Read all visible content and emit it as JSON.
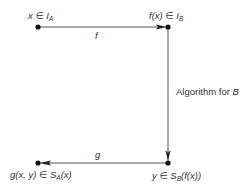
{
  "diagram": {
    "nodes": {
      "top_left": {
        "var": "x",
        "rel": "∈",
        "set": "I",
        "sub": "A"
      },
      "top_right": {
        "var": "f(x)",
        "rel": "∈",
        "set": "I",
        "sub": "B"
      },
      "bottom_right": {
        "var": "y",
        "rel": "∈",
        "set": "S",
        "sub": "B",
        "arg": "(f(x))"
      },
      "bottom_left": {
        "var": "g(x, y)",
        "rel": "∈",
        "set": "S",
        "sub": "A",
        "arg": "(x)"
      }
    },
    "edges": {
      "top": {
        "label": "f",
        "direction": "right"
      },
      "right": {
        "label_prefix": "Algorithm for ",
        "label_var": "B",
        "direction": "down"
      },
      "bottom": {
        "label": "g",
        "direction": "left"
      }
    },
    "colors": {
      "line": "#555555",
      "dot": "#111111",
      "arrow": "#222222"
    }
  }
}
